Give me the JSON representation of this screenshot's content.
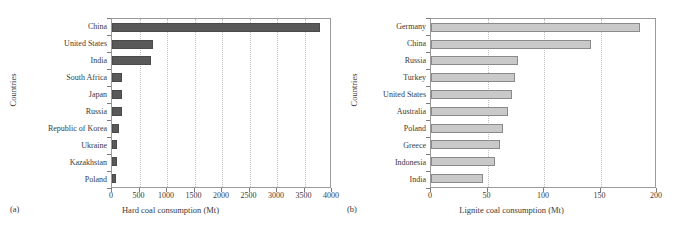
{
  "chart_data": [
    {
      "type": "bar",
      "orientation": "horizontal",
      "panel_tag": "(a)",
      "title": "",
      "xlabel": "Hard coal consumption (Mt)",
      "ylabel": "Countries",
      "xlim": [
        0,
        4000
      ],
      "xticks": [
        0,
        500,
        1000,
        1500,
        2000,
        2500,
        3000,
        3500,
        4000
      ],
      "xticklabels": [
        "0",
        "500",
        "1000",
        "1500",
        "2000",
        "2500",
        "3000",
        "3500",
        "4000"
      ],
      "grid": "vertical-dotted",
      "legend": "none",
      "bar_color": "#595959",
      "categories": [
        "China",
        "United States",
        "India",
        "South Africa",
        "Japan",
        "Russia",
        "Republic of Korea",
        "Ukraine",
        "Kazakhstan",
        "Poland"
      ],
      "values": [
        3790,
        745,
        700,
        185,
        185,
        175,
        130,
        90,
        85,
        75
      ]
    },
    {
      "type": "bar",
      "orientation": "horizontal",
      "panel_tag": "(b)",
      "title": "",
      "xlabel": "Lignite coal consumption (Mt)",
      "ylabel": "Countries",
      "xlim": [
        0,
        200
      ],
      "xticks": [
        0,
        50,
        100,
        150,
        200
      ],
      "xticklabels": [
        "0",
        "50",
        "100",
        "150",
        "200"
      ],
      "grid": "vertical-dotted",
      "legend": "none",
      "bar_color": "#c9c9c9",
      "categories": [
        "Germany",
        "China",
        "Russia",
        "Turkey",
        "United States",
        "Australia",
        "Poland",
        "Greece",
        "Indonesia",
        "India"
      ],
      "values": [
        185,
        142,
        77,
        74,
        72,
        68,
        64,
        61,
        57,
        46
      ]
    }
  ]
}
